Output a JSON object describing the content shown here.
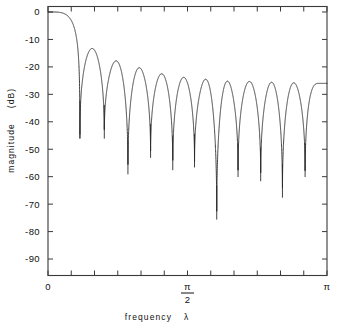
{
  "chart_data": {
    "type": "line",
    "title": "",
    "xlabel": "frequency  λ",
    "ylabel": "magnitude  (dB)",
    "xlim": [
      0,
      3.14159265
    ],
    "ylim": [
      -96,
      2
    ],
    "grid": false,
    "legend": null,
    "x_ticks": [
      {
        "value": 0,
        "label": "0"
      },
      {
        "value": 0.2617994,
        "label": ""
      },
      {
        "value": 0.5235988,
        "label": ""
      },
      {
        "value": 0.7853982,
        "label": ""
      },
      {
        "value": 1.0471976,
        "label": ""
      },
      {
        "value": 1.3089969,
        "label": ""
      },
      {
        "value": 1.5707963,
        "label": "π/2"
      },
      {
        "value": 1.8325957,
        "label": ""
      },
      {
        "value": 2.0943951,
        "label": ""
      },
      {
        "value": 2.3561945,
        "label": ""
      },
      {
        "value": 2.6179939,
        "label": ""
      },
      {
        "value": 2.8797933,
        "label": ""
      },
      {
        "value": 3.1415927,
        "label": "π"
      }
    ],
    "y_ticks": [
      {
        "value": 0,
        "label": "0"
      },
      {
        "value": -10,
        "label": "-10"
      },
      {
        "value": -20,
        "label": "-20"
      },
      {
        "value": -30,
        "label": "-30"
      },
      {
        "value": -40,
        "label": "-40"
      },
      {
        "value": -50,
        "label": "-50"
      },
      {
        "value": -60,
        "label": "-60"
      },
      {
        "value": -70,
        "label": "-70"
      },
      {
        "value": -80,
        "label": "-80"
      },
      {
        "value": -90,
        "label": "-90"
      }
    ],
    "series": [
      {
        "name": "magnitude response",
        "color": "#2b2b2b",
        "description": "FIR lowpass filter magnitude response in dB: passband at 0 dB near lambda=0, main lobe rolloff, followed by twelve spectral nulls separated by decaying sidelobes.",
        "passband_level_db": 0,
        "sidelobe_peaks_db": [
          -13.3,
          -17.8,
          -20.3,
          -22.5,
          -23.8,
          -24.5,
          -25.2,
          -25.3,
          -25.6,
          -25.8,
          -26.0
        ],
        "null_frequencies": [
          0.36,
          0.634,
          0.9,
          1.155,
          1.405,
          1.65,
          1.9,
          2.14,
          2.395,
          2.64,
          2.895
        ],
        "null_depths_db": [
          -44.5,
          -46.0,
          -59.0,
          -53.0,
          -57.5,
          -56.5,
          -75.5,
          -60.0,
          -61.5,
          -67.5,
          -60.0
        ],
        "endpoint_db": -26.0
      }
    ]
  },
  "axis_labels": {
    "x_title": "frequency",
    "x_symbol": "λ",
    "y_title": "magnitude",
    "y_units": "(dB)",
    "pi_numerator": "π",
    "pi_denominator": "2",
    "x_left": "0",
    "x_right": "π"
  }
}
